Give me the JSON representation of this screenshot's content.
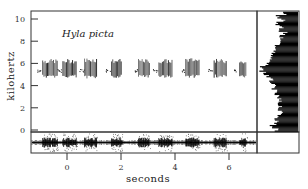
{
  "chart_data": {
    "type": "scatter",
    "title": "Hyla picta",
    "xlabel": "seconds",
    "ylabel": "kilohertz",
    "xlim": [
      -1.1,
      7.1
    ],
    "ylim": [
      -0.1,
      10.8
    ],
    "x_ticks": [
      0,
      2,
      4,
      6
    ],
    "y_ticks": [
      0,
      2,
      4,
      6,
      8,
      10
    ],
    "grid": false,
    "panels": [
      "spectrogram",
      "frequency-spectrum",
      "waveform"
    ],
    "calls": [
      {
        "start": -0.9,
        "end": -0.35,
        "freq_low": 5.0,
        "freq_high": 6.0
      },
      {
        "start": -0.15,
        "end": 0.35,
        "freq_low": 5.0,
        "freq_high": 6.0
      },
      {
        "start": 0.65,
        "end": 1.1,
        "freq_low": 4.9,
        "freq_high": 6.1
      },
      {
        "start": 1.65,
        "end": 2.05,
        "freq_low": 5.0,
        "freq_high": 6.0
      },
      {
        "start": 2.65,
        "end": 3.05,
        "freq_low": 5.0,
        "freq_high": 6.0
      },
      {
        "start": 3.4,
        "end": 3.9,
        "freq_low": 5.0,
        "freq_high": 6.0
      },
      {
        "start": 4.4,
        "end": 4.9,
        "freq_low": 5.0,
        "freq_high": 6.1
      },
      {
        "start": 5.45,
        "end": 5.9,
        "freq_low": 5.0,
        "freq_high": 6.0
      },
      {
        "start": 6.4,
        "end": 6.65,
        "freq_low": 5.0,
        "freq_high": 5.9
      }
    ],
    "spectrum_peak_khz": 5.6,
    "spectrum": [
      [
        10.6,
        0.35
      ],
      [
        10.3,
        0.55
      ],
      [
        10.0,
        0.4
      ],
      [
        9.7,
        0.6
      ],
      [
        9.4,
        0.45
      ],
      [
        9.1,
        0.5
      ],
      [
        8.8,
        0.35
      ],
      [
        8.5,
        0.45
      ],
      [
        8.2,
        0.4
      ],
      [
        7.9,
        0.5
      ],
      [
        7.6,
        0.55
      ],
      [
        7.3,
        0.6
      ],
      [
        7.0,
        0.65
      ],
      [
        6.7,
        0.7
      ],
      [
        6.4,
        0.75
      ],
      [
        6.1,
        0.82
      ],
      [
        5.8,
        0.93
      ],
      [
        5.5,
        0.95
      ],
      [
        5.2,
        0.88
      ],
      [
        4.9,
        0.78
      ],
      [
        4.6,
        0.72
      ],
      [
        4.3,
        0.68
      ],
      [
        4.0,
        0.65
      ],
      [
        3.7,
        0.62
      ],
      [
        3.4,
        0.6
      ],
      [
        3.1,
        0.55
      ],
      [
        2.8,
        0.5
      ],
      [
        2.5,
        0.5
      ],
      [
        2.2,
        0.45
      ],
      [
        1.9,
        0.5
      ],
      [
        1.6,
        0.45
      ],
      [
        1.3,
        0.5
      ],
      [
        1.0,
        0.55
      ],
      [
        0.7,
        0.6
      ],
      [
        0.4,
        0.7
      ],
      [
        0.1,
        0.55
      ]
    ]
  },
  "labels": {
    "species": "Hyla picta",
    "xlabel": "seconds",
    "ylabel": "kilohertz",
    "x_ticks": [
      "0",
      "2",
      "4",
      "6"
    ],
    "y_ticks": [
      "0",
      "2",
      "4",
      "6",
      "8",
      "10"
    ]
  }
}
